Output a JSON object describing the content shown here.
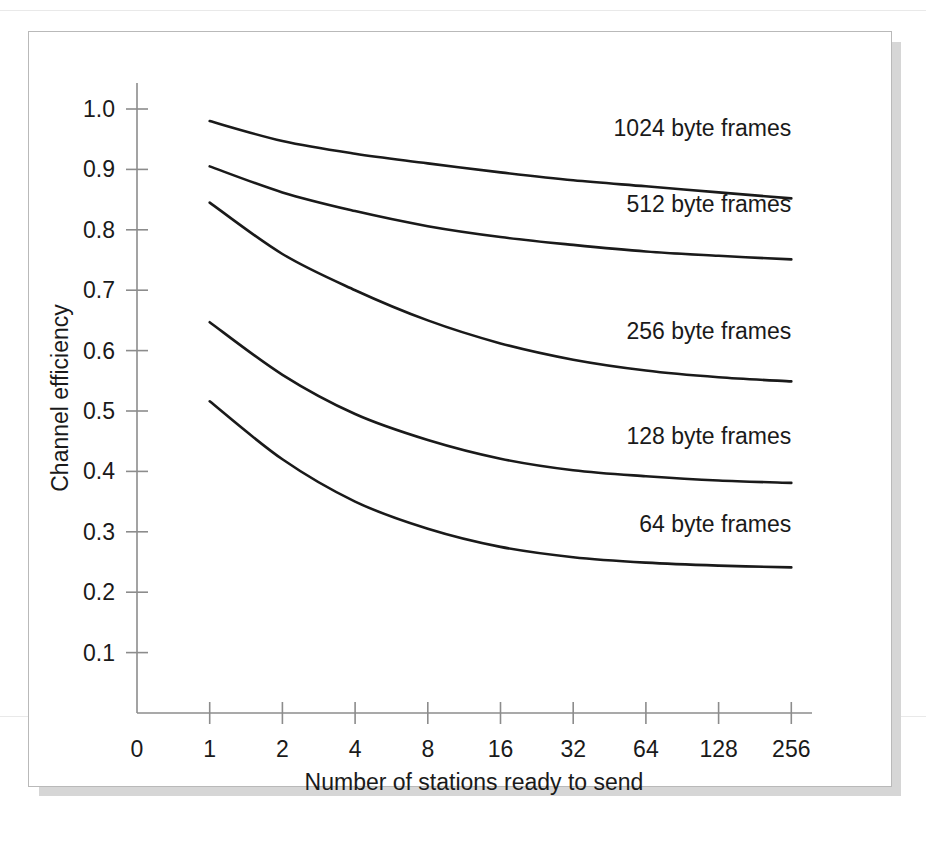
{
  "figure": {
    "frame_color": "#b9b9b9",
    "shadow_color": "#d6d6d6",
    "background": "#ffffff",
    "ink_color": "#1a1a1a",
    "axis_color": "#8c8c8c"
  },
  "chart_data": {
    "type": "line",
    "title": "",
    "subtitle": "",
    "xlabel": "Number of stations ready to send",
    "ylabel": "Channel efficiency",
    "x_tick_labels": [
      "0",
      "1",
      "2",
      "4",
      "8",
      "16",
      "32",
      "64",
      "128",
      "256"
    ],
    "x_tick_values": [
      0,
      1,
      2,
      4,
      8,
      16,
      32,
      64,
      128,
      256
    ],
    "x_scale": "log2-with-zero-origin",
    "y_tick_labels": [
      "0.1",
      "0.2",
      "0.3",
      "0.4",
      "0.5",
      "0.6",
      "0.7",
      "0.8",
      "0.9",
      "1.0"
    ],
    "y_tick_values": [
      0.1,
      0.2,
      0.3,
      0.4,
      0.5,
      0.6,
      0.7,
      0.8,
      0.9,
      1.0
    ],
    "ylim": [
      0,
      1.0
    ],
    "grid": false,
    "legend_position": "inline-above-each-curve",
    "x": [
      1,
      2,
      4,
      8,
      16,
      32,
      64,
      128,
      256
    ],
    "series": [
      {
        "name": "1024 byte frames",
        "label": "1024 byte frames",
        "values": [
          0.98,
          0.947,
          0.926,
          0.91,
          0.895,
          0.882,
          0.872,
          0.862,
          0.852
        ],
        "label_x": 256,
        "label_y": 0.955
      },
      {
        "name": "512 byte frames",
        "label": "512 byte frames",
        "values": [
          0.905,
          0.862,
          0.831,
          0.806,
          0.788,
          0.775,
          0.764,
          0.757,
          0.751
        ],
        "label_x": 256,
        "label_y": 0.83
      },
      {
        "name": "256 byte frames",
        "label": "256 byte frames",
        "values": [
          0.845,
          0.76,
          0.7,
          0.65,
          0.612,
          0.585,
          0.567,
          0.556,
          0.549
        ],
        "label_x": 256,
        "label_y": 0.62
      },
      {
        "name": "128 byte frames",
        "label": "128 byte frames",
        "values": [
          0.647,
          0.56,
          0.495,
          0.452,
          0.421,
          0.402,
          0.392,
          0.385,
          0.381
        ],
        "label_x": 256,
        "label_y": 0.445
      },
      {
        "name": "64 byte frames",
        "label": "64 byte frames",
        "values": [
          0.516,
          0.42,
          0.35,
          0.305,
          0.275,
          0.258,
          0.249,
          0.244,
          0.241
        ],
        "label_x": 256,
        "label_y": 0.3
      }
    ]
  }
}
